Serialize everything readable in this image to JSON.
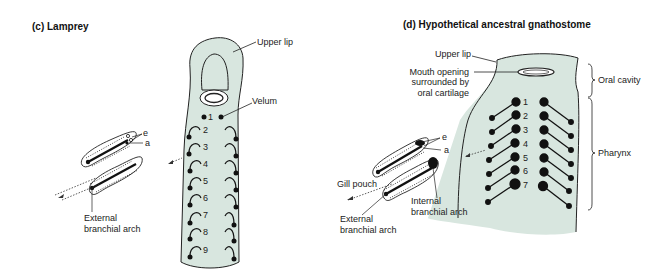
{
  "colors": {
    "body_fill": "#d8e6df",
    "outline": "#222222",
    "dot": "#111111",
    "background": "#ffffff"
  },
  "panel_c": {
    "title": "(c) Lamprey",
    "labels": {
      "upper_lip": "Upper lip",
      "velum": "Velum",
      "e": "e",
      "a": "a",
      "external_branchial_arch_1": "External",
      "external_branchial_arch_2": "branchial arch"
    },
    "gill_numbers": [
      "1",
      "2",
      "3",
      "4",
      "5",
      "6",
      "7",
      "8",
      "9"
    ]
  },
  "panel_d": {
    "title": "(d) Hypothetical ancestral gnathostome",
    "labels": {
      "upper_lip": "Upper lip",
      "mouth_opening_1": "Mouth opening",
      "mouth_opening_2": "surrounded by",
      "mouth_opening_3": "oral cartilage",
      "oral_cavity": "Oral cavity",
      "pharynx": "Pharynx",
      "e": "e",
      "a": "a",
      "gill_pouch": "Gill pouch",
      "internal_branchial_arch_1": "Internal",
      "internal_branchial_arch_2": "branchial arch",
      "external_branchial_arch_1": "External",
      "external_branchial_arch_2": "branchial arch"
    },
    "gill_numbers": [
      "1",
      "2",
      "3",
      "4",
      "5",
      "6",
      "7"
    ]
  }
}
